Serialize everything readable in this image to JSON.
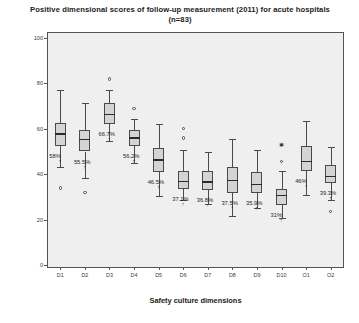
{
  "chart_data": {
    "type": "box",
    "title": "Positive dimensional scores of follow-up measurement (2011) for acute hospitals (n=83)",
    "xlabel": "Safety culture dimensions",
    "ylabel": "% positive response",
    "ylim": [
      0,
      100
    ],
    "yticks": [
      "0",
      "20",
      "40",
      "60",
      "80",
      "100"
    ],
    "grid": false,
    "legend": "none",
    "categories": [
      "D1",
      "D2",
      "D3",
      "D4",
      "D5",
      "D6",
      "D7",
      "D8",
      "D9",
      "D10",
      "O1",
      "O2"
    ],
    "median_labels": [
      "58%",
      "55.5%",
      "66.7%",
      "56.2%",
      "46.5%",
      "37.1%",
      "36.8%",
      "37.5%",
      "35.9%",
      "31%",
      "46%",
      "39.3%"
    ],
    "boxes": [
      {
        "category": "D1",
        "lower_whisker": 43.0,
        "q1": 52.5,
        "median": 58.0,
        "q3": 62.5,
        "upper_whisker": 77.0,
        "outliers": [
          34.0
        ],
        "extremes": []
      },
      {
        "category": "D2",
        "lower_whisker": 38.5,
        "q1": 50.0,
        "median": 55.5,
        "q3": 59.5,
        "upper_whisker": 71.5,
        "outliers": [
          32.0
        ],
        "extremes": []
      },
      {
        "category": "D3",
        "lower_whisker": 54.5,
        "q1": 62.0,
        "median": 66.7,
        "q3": 71.5,
        "upper_whisker": 77.0,
        "outliers": [
          82.0
        ],
        "extremes": []
      },
      {
        "category": "D4",
        "lower_whisker": 45.0,
        "q1": 52.5,
        "median": 56.2,
        "q3": 59.5,
        "upper_whisker": 64.5,
        "outliers": [
          69.0
        ],
        "extremes": []
      },
      {
        "category": "D5",
        "lower_whisker": 30.5,
        "q1": 41.0,
        "median": 46.5,
        "q3": 51.5,
        "upper_whisker": 62.0,
        "outliers": [],
        "extremes": []
      },
      {
        "category": "D6",
        "lower_whisker": 28.5,
        "q1": 33.5,
        "median": 37.1,
        "q3": 41.5,
        "upper_whisker": 50.5,
        "outliers": [
          56.0,
          60.0
        ],
        "extremes": []
      },
      {
        "category": "D7",
        "lower_whisker": 27.0,
        "q1": 33.0,
        "median": 36.8,
        "q3": 41.5,
        "upper_whisker": 50.0,
        "outliers": [],
        "extremes": []
      },
      {
        "category": "D8",
        "lower_whisker": 21.5,
        "q1": 31.5,
        "median": 37.5,
        "q3": 43.0,
        "upper_whisker": 55.5,
        "outliers": [],
        "extremes": []
      },
      {
        "category": "D9",
        "lower_whisker": 25.0,
        "q1": 31.5,
        "median": 35.9,
        "q3": 41.0,
        "upper_whisker": 50.5,
        "outliers": [],
        "extremes": []
      },
      {
        "category": "D10",
        "lower_whisker": 20.5,
        "q1": 26.5,
        "median": 31.0,
        "q3": 33.5,
        "upper_whisker": 41.5,
        "outliers": [
          45.5
        ],
        "extremes": [
          53.0
        ]
      },
      {
        "category": "O1",
        "lower_whisker": 31.0,
        "q1": 41.5,
        "median": 46.0,
        "q3": 52.5,
        "upper_whisker": 63.5,
        "outliers": [],
        "extremes": []
      },
      {
        "category": "O2",
        "lower_whisker": 28.5,
        "q1": 36.0,
        "median": 39.3,
        "q3": 44.0,
        "upper_whisker": 52.0,
        "outliers": [
          23.5
        ],
        "extremes": []
      }
    ]
  },
  "colors": {
    "plot_background": "#efefef",
    "box_fill": "#d4d4d4",
    "line": "#4a4a4a",
    "text": "#1b1b1b"
  }
}
